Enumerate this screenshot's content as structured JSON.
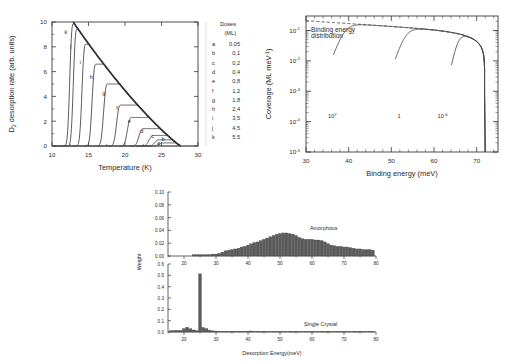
{
  "figure": {
    "panels": [
      "tpd-spectra",
      "coverage-binding-energy",
      "desorption-energy-distributions"
    ]
  },
  "panel_a": {
    "name": "TPD spectra",
    "legend": {
      "title": "Doses",
      "subtitle": "(ML)",
      "entries": [
        {
          "key": "a",
          "value": "0,05"
        },
        {
          "key": "b",
          "value": "0,1"
        },
        {
          "key": "c",
          "value": "0,2"
        },
        {
          "key": "d",
          "value": "0,4"
        },
        {
          "key": "e",
          "value": "0,8"
        },
        {
          "key": "f",
          "value": "1,2"
        },
        {
          "key": "g",
          "value": "1,8"
        },
        {
          "key": "h",
          "value": "2,4"
        },
        {
          "key": "i",
          "value": "3,5"
        },
        {
          "key": "j",
          "value": "4,5"
        },
        {
          "key": "k",
          "value": "5,5"
        }
      ]
    }
  },
  "panel_b": {
    "name": "Coverage vs binding energy"
  },
  "panel_c": {
    "name": "Desorption energy distributions"
  },
  "chart_data": [
    {
      "type": "line",
      "id": "tpd-spectra",
      "title": "",
      "xlabel": "Temperature (K)",
      "ylabel": "D  desorption rate (arb. units)",
      "ylabel_sub": "2",
      "xlim": [
        10,
        30
      ],
      "ylim": [
        0,
        10
      ],
      "xticks": [
        10,
        15,
        20,
        25,
        30
      ],
      "yticks": [
        0,
        2,
        4,
        6,
        8,
        10
      ],
      "grid": false,
      "legend_position": "right-outside",
      "series": [
        {
          "name": "a",
          "dose_ML": 0.05,
          "peak_temperature_K": 25.3,
          "peak_value": 0.25
        },
        {
          "name": "b",
          "dose_ML": 0.1,
          "peak_temperature_K": 24.7,
          "peak_value": 0.5
        },
        {
          "name": "c",
          "dose_ML": 0.2,
          "peak_temperature_K": 23.9,
          "peak_value": 0.85
        },
        {
          "name": "d",
          "dose_ML": 0.4,
          "peak_temperature_K": 22.5,
          "peak_value": 1.4
        },
        {
          "name": "e",
          "dose_ML": 0.8,
          "peak_temperature_K": 20.9,
          "peak_value": 2.3
        },
        {
          "name": "f",
          "dose_ML": 1.2,
          "peak_temperature_K": 19.4,
          "peak_value": 3.3
        },
        {
          "name": "g",
          "dose_ML": 1.8,
          "peak_temperature_K": 17.6,
          "peak_value": 5.0
        },
        {
          "name": "h",
          "dose_ML": 2.4,
          "peak_temperature_K": 16.0,
          "peak_value": 6.6
        },
        {
          "name": "i",
          "dose_ML": 3.5,
          "peak_temperature_K": 14.6,
          "peak_value": 8.2
        },
        {
          "name": "j",
          "dose_ML": 4.5,
          "peak_temperature_K": 13.4,
          "peak_value": 9.4
        },
        {
          "name": "k",
          "dose_ML": 5.5,
          "peak_temperature_K": 12.9,
          "peak_value": 9.85
        }
      ]
    },
    {
      "type": "line",
      "id": "coverage-binding-energy",
      "title": "",
      "xlabel": "Binding energy (meV)",
      "ylabel": "Coverage (ML meV  )",
      "ylabel_sup": "-1",
      "xlim": [
        30,
        75
      ],
      "ylim": [
        1e-05,
        0.3
      ],
      "yscale": "log",
      "xticks": [
        30,
        40,
        50,
        60,
        70
      ],
      "ytick_labels": [
        "10",
        "10",
        "10",
        "10",
        "10"
      ],
      "ytick_exponents": [
        "-1",
        "-2",
        "-3",
        "-4",
        "-5"
      ],
      "grid": false,
      "annotations": [
        {
          "text": "Binding energy",
          "x": 33,
          "y_rel": 0.93
        },
        {
          "text": "distribution",
          "x": 33,
          "y_rel": 0.86
        }
      ],
      "series": [
        {
          "name": "10",
          "exponent": "7",
          "label_x": 38.5,
          "onset_meV": 36.5,
          "plateau_meV": 46,
          "cutoff_meV": 71.8
        },
        {
          "name": "1",
          "exponent": "",
          "label_x": 53.5,
          "onset_meV": 51,
          "plateau_meV": 60,
          "cutoff_meV": 71.8
        },
        {
          "name": "10",
          "exponent": "-6",
          "label_x": 64.5,
          "onset_meV": 64.2,
          "plateau_meV": 69.5,
          "cutoff_meV": 71.8
        },
        {
          "name": "Binding energy distribution",
          "style": "dashed",
          "envelope": true
        }
      ]
    },
    {
      "type": "bar",
      "id": "desorption-energy-amorphous",
      "title": "Amorphous",
      "xlabel": "",
      "ylabel": "Weight",
      "xlim": [
        15,
        80
      ],
      "ylim": [
        0.0,
        0.1
      ],
      "xticks": [
        20,
        30,
        40,
        50,
        60,
        70,
        80
      ],
      "yticks": [
        "0.00",
        "0.02",
        "0.04",
        "0.06",
        "0.08",
        "0.10"
      ],
      "grid": false,
      "bin_width_meV": 1,
      "bin_start_meV": 23,
      "values": [
        0.002,
        0.002,
        0.002,
        0.002,
        0.002,
        0.002,
        0.003,
        0.003,
        0.004,
        0.006,
        0.008,
        0.009,
        0.01,
        0.011,
        0.012,
        0.014,
        0.015,
        0.017,
        0.019,
        0.021,
        0.022,
        0.024,
        0.026,
        0.028,
        0.03,
        0.032,
        0.034,
        0.035,
        0.036,
        0.036,
        0.035,
        0.034,
        0.032,
        0.029,
        0.027,
        0.026,
        0.026,
        0.026,
        0.025,
        0.025,
        0.024,
        0.022,
        0.019,
        0.017,
        0.016,
        0.015,
        0.015,
        0.014,
        0.014,
        0.013,
        0.012,
        0.011,
        0.011,
        0.01,
        0.01,
        0.01,
        0.009
      ]
    },
    {
      "type": "bar",
      "id": "desorption-energy-single-crystal",
      "title": "Single Crystal",
      "xlabel": "Desorption Energy(meV)",
      "ylabel": "Weight",
      "xlim": [
        15,
        80
      ],
      "ylim": [
        0.0,
        0.6
      ],
      "xticks": [
        20,
        30,
        40,
        50,
        60,
        70,
        80
      ],
      "yticks": [
        "0.0",
        "0.1",
        "0.2",
        "0.3",
        "0.4",
        "0.5",
        "0.6"
      ],
      "grid": false,
      "bin_width_meV": 1,
      "bin_start_meV": 16,
      "values": [
        0.012,
        0.014,
        0.013,
        0.015,
        0.03,
        0.042,
        0.028,
        0.018,
        0.012,
        0.513,
        0.04,
        0.03,
        0.016,
        0.01,
        0.008,
        0.006,
        0.005,
        0.004,
        0.004,
        0.006,
        0.005,
        0.004,
        0.003,
        0.004,
        0.007,
        0.009,
        0.005,
        0.004,
        0.003,
        0.003,
        0.003,
        0.002,
        0.002,
        0.002,
        0.002,
        0.002,
        0.002,
        0.002,
        0.002,
        0.002,
        0.002,
        0.002,
        0.002,
        0.002,
        0.002,
        0.002,
        0.002,
        0.002,
        0.002,
        0.002,
        0.002,
        0.002,
        0.002,
        0.002,
        0.002,
        0.002,
        0.002,
        0.002,
        0.002,
        0.002,
        0.002,
        0.002,
        0.002,
        0.002
      ]
    }
  ]
}
